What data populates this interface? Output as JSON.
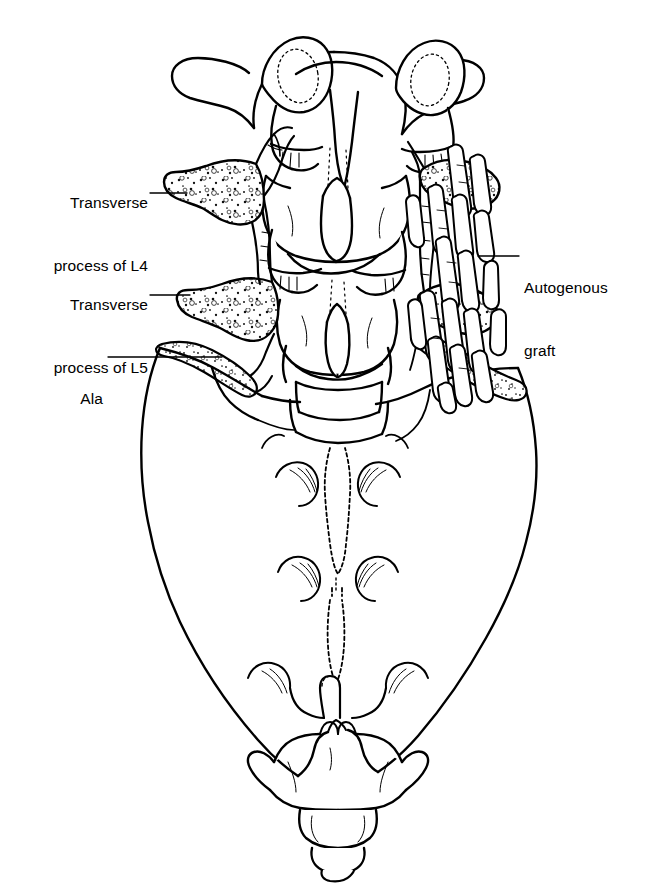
{
  "figure": {
    "view": "Posterior view of the lower lumbar spine, sacrum and coccyx",
    "background_color": "#ffffff",
    "ink_color": "#000000",
    "width": 652,
    "height": 891
  },
  "labels": [
    {
      "id": "transverse-process-l4",
      "line1": "Transverse",
      "line2": "process of L4",
      "align": "right",
      "text_x": 48,
      "text_y": 150,
      "text_width": 100,
      "leader": {
        "x1": 150,
        "y1": 193,
        "x2": 187,
        "y2": 193
      }
    },
    {
      "id": "transverse-process-l5",
      "line1": "Transverse",
      "line2": "process of L5",
      "align": "right",
      "text_x": 48,
      "text_y": 252,
      "text_width": 100,
      "leader": {
        "x1": 150,
        "y1": 295,
        "x2": 190,
        "y2": 295
      }
    },
    {
      "id": "ala",
      "line1": "Ala",
      "line2": "",
      "align": "right",
      "text_x": 48,
      "text_y": 340,
      "text_width": 100,
      "leader": {
        "x1": 108,
        "y1": 357,
        "x2": 222,
        "y2": 357
      }
    },
    {
      "id": "autogenous-graft",
      "line1": "Autogenous",
      "line2": "graft",
      "align": "left",
      "text_x": 524,
      "text_y": 235,
      "text_width": 120,
      "leader": {
        "x1": 478,
        "y1": 256,
        "x2": 519,
        "y2": 256
      }
    }
  ],
  "structures": {
    "vertebra_l3": "Upper lumbar vertebra with transverse processes and superior articular facets",
    "vertebra_l4": "Middle lumbar vertebra, L4",
    "vertebra_l5": "Lower lumbar vertebra, L5",
    "sacrum": "Sacrum with median sacral crest and four pairs of posterior sacral foramina",
    "coccyx": "Coccygeal segments",
    "graft_strips": 18,
    "decorticated_bone": "Stippled cancellous bone surfaces of transverse processes, facet joints and sacral ala"
  }
}
